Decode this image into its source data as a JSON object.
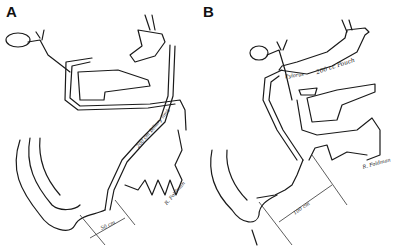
{
  "figure": {
    "panels": [
      {
        "label": "A",
        "annotations": {
          "limb_label": "200 cm Biliary limb",
          "measurement": "50 cm",
          "signature": "R. Foldman"
        }
      },
      {
        "label": "B",
        "annotations": {
          "pylorus": "Pylorus",
          "pouch": "200 cc Pouch",
          "measurement": "100 cm",
          "signature": "R. Foldman"
        }
      }
    ]
  }
}
